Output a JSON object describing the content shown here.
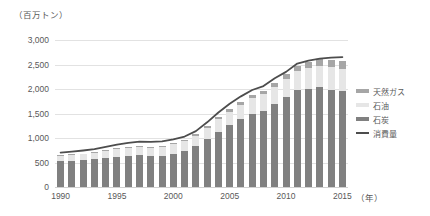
{
  "chart_data": {
    "type": "bar",
    "title": "",
    "unit_label": "（百万トン）",
    "xlabel": "（年）",
    "ylabel": "",
    "ylim": [
      0,
      3000
    ],
    "ytick_labels": [
      "3,000",
      "2,500",
      "2,000",
      "1,500",
      "1,000",
      "500",
      "0"
    ],
    "ytick_values": [
      3000,
      2500,
      2000,
      1500,
      1000,
      500,
      0
    ],
    "xtick_labels": [
      "1990",
      "1995",
      "2000",
      "2005",
      "2010",
      "2015"
    ],
    "xtick_values": [
      1990,
      1995,
      2000,
      2005,
      2010,
      2015
    ],
    "grid": true,
    "legend_position": "right",
    "categories": [
      1990,
      1991,
      1992,
      1993,
      1994,
      1995,
      1996,
      1997,
      1998,
      1999,
      2000,
      2001,
      2002,
      2003,
      2004,
      2005,
      2006,
      2007,
      2008,
      2009,
      2010,
      2011,
      2012,
      2013,
      2014,
      2015
    ],
    "stacked": true,
    "series": [
      {
        "name": "石炭",
        "kind": "bar",
        "color": "#808080",
        "values": [
          530,
          540,
          550,
          570,
          600,
          620,
          640,
          650,
          630,
          640,
          680,
          740,
          840,
          980,
          1120,
          1260,
          1380,
          1500,
          1560,
          1700,
          1830,
          1970,
          2010,
          2040,
          1990,
          1950
        ]
      },
      {
        "name": "石油",
        "kind": "bar",
        "color": "#e6e6e6",
        "values": [
          110,
          115,
          120,
          130,
          140,
          150,
          160,
          170,
          175,
          185,
          195,
          200,
          210,
          230,
          260,
          280,
          300,
          320,
          330,
          350,
          380,
          400,
          420,
          440,
          450,
          460
        ]
      },
      {
        "name": "天然ガス",
        "kind": "bar",
        "color": "#a6a6a6",
        "values": [
          12,
          13,
          14,
          15,
          16,
          17,
          18,
          20,
          21,
          22,
          24,
          26,
          30,
          34,
          40,
          46,
          55,
          64,
          72,
          82,
          95,
          110,
          125,
          140,
          150,
          160
        ]
      },
      {
        "name": "消費量",
        "kind": "line",
        "color": "#4d4d4d",
        "values": [
          700,
          720,
          745,
          775,
          820,
          865,
          900,
          925,
          920,
          930,
          970,
          1030,
          1140,
          1320,
          1520,
          1700,
          1850,
          1980,
          2060,
          2220,
          2350,
          2520,
          2580,
          2620,
          2640,
          2650
        ]
      }
    ]
  }
}
